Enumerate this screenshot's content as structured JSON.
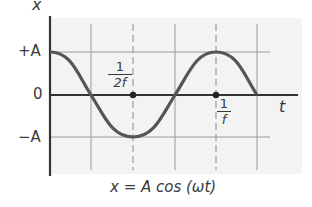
{
  "diagram": {
    "axes": {
      "y_label": "x",
      "x_label": "t",
      "y_ticks": [
        "+A",
        "0",
        "−A"
      ]
    },
    "markers": [
      {
        "label_num": "1",
        "label_den": "2f",
        "position": "half period"
      },
      {
        "label_num": "1",
        "label_den": "f",
        "position": "full period"
      }
    ],
    "equation": "x = A cos (ωt)",
    "colors": {
      "curve": "#555555",
      "axis": "#333333",
      "grid": "#9a9a9a",
      "background": "#f3f3f3"
    }
  }
}
